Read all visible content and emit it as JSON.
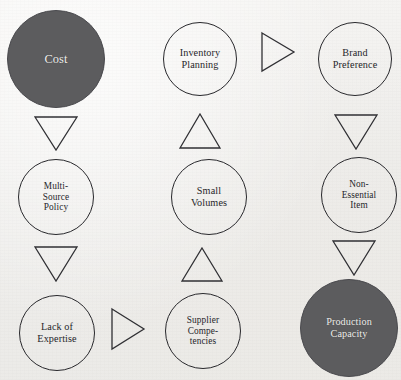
{
  "diagram": {
    "type": "influence-diagram",
    "background_color": "#f1f0ee",
    "node_fill_color": "#5c5c5e",
    "node_stroke_color": "#28282c",
    "columns": 3,
    "rows": 3,
    "nodes": [
      {
        "id": "cost",
        "label": "Cost",
        "row": 1,
        "column": 1,
        "style": "filled",
        "size": "large"
      },
      {
        "id": "inventory-planning",
        "label": "Inventory\nPlanning",
        "row": 1,
        "column": 2,
        "style": "outline",
        "size": "small"
      },
      {
        "id": "brand-preference",
        "label": "Brand\nPreference",
        "row": 1,
        "column": 3,
        "style": "outline",
        "size": "small"
      },
      {
        "id": "multi-source-policy",
        "label": "Multi-\nSource\nPolicy",
        "row": 2,
        "column": 1,
        "style": "outline",
        "size": "small"
      },
      {
        "id": "small-volumes",
        "label": "Small\nVolumes",
        "row": 2,
        "column": 2,
        "style": "outline",
        "size": "small"
      },
      {
        "id": "non-essential-item",
        "label": "Non-\nEssential\nItem",
        "row": 2,
        "column": 3,
        "style": "outline",
        "size": "small"
      },
      {
        "id": "lack-of-expertise",
        "label": "Lack of\nExpertise",
        "row": 3,
        "column": 1,
        "style": "outline",
        "size": "small"
      },
      {
        "id": "supplier-competencies",
        "label": "Supplier\nCompe-\ntencies",
        "row": 3,
        "column": 2,
        "style": "outline",
        "size": "small"
      },
      {
        "id": "production-capacity",
        "label": "Production\nCapacity",
        "row": 3,
        "column": 3,
        "style": "filled",
        "size": "large"
      }
    ],
    "connectors": [
      {
        "id": "cost-to-multi-source-policy",
        "direction": "down",
        "from": "cost",
        "to": "multi-source-policy"
      },
      {
        "id": "small-volumes-to-inventory-planning",
        "direction": "up",
        "from": "small-volumes",
        "to": "inventory-planning"
      },
      {
        "id": "inventory-planning-to-brand-preference",
        "direction": "right",
        "from": "inventory-planning",
        "to": "brand-preference"
      },
      {
        "id": "brand-preference-to-non-essential-item",
        "direction": "down",
        "from": "brand-preference",
        "to": "non-essential-item"
      },
      {
        "id": "multi-source-policy-to-lack-of-expertise",
        "direction": "down",
        "from": "multi-source-policy",
        "to": "lack-of-expertise"
      },
      {
        "id": "supplier-competencies-to-small-volumes",
        "direction": "up",
        "from": "supplier-competencies",
        "to": "small-volumes"
      },
      {
        "id": "non-essential-item-to-production-capacity",
        "direction": "down",
        "from": "non-essential-item",
        "to": "production-capacity"
      },
      {
        "id": "lack-of-expertise-to-supplier-competencies",
        "direction": "right",
        "from": "lack-of-expertise",
        "to": "supplier-competencies"
      }
    ]
  }
}
